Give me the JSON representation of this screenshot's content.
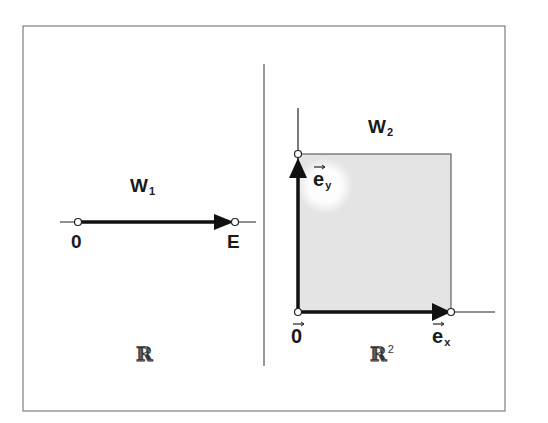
{
  "diagram": {
    "left_panel": {
      "title": "W",
      "title_sub": "1",
      "origin_label": "0",
      "end_label": "E",
      "space_label": "ℝ",
      "space_sup": ""
    },
    "right_panel": {
      "title": "W",
      "title_sub": "2",
      "origin_label": "0",
      "ex_label": "e",
      "ex_sub": "x",
      "ey_label": "e",
      "ey_sub": "y",
      "space_label": "ℝ",
      "space_sup": "2"
    },
    "colors": {
      "frame": "#555555",
      "stroke": "#1a1a1a",
      "fill": "#e6e6e6"
    }
  }
}
